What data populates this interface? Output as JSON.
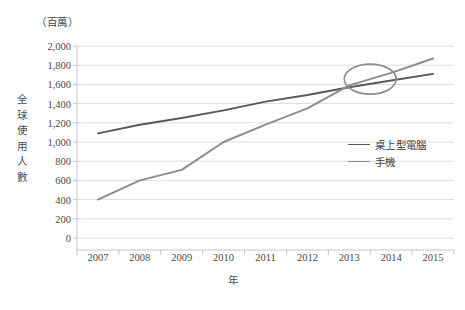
{
  "chart_data": {
    "type": "line",
    "title": "",
    "unit_label": "（百萬）",
    "xlabel": "年",
    "ylabel": "全球使用人數",
    "ylabel_chars": [
      "全",
      "球",
      "使",
      "用",
      "人",
      "數"
    ],
    "categories": [
      "2007",
      "2008",
      "2009",
      "2010",
      "2011",
      "2012",
      "2013",
      "2014",
      "2015"
    ],
    "x": [
      2007,
      2008,
      2009,
      2010,
      2011,
      2012,
      2013,
      2014,
      2015
    ],
    "ylim": [
      0,
      2000
    ],
    "ytick_values": [
      0,
      200,
      400,
      600,
      800,
      1000,
      1200,
      1400,
      1600,
      1800,
      2000
    ],
    "ytick_labels": [
      "0",
      "200",
      "400",
      "600",
      "800",
      "1,000",
      "1,200",
      "1,400",
      "1,600",
      "1,800",
      "2,000"
    ],
    "grid": "horizontal",
    "legend_position": "inside-right",
    "series": [
      {
        "name": "桌上型電腦",
        "color": "#595959",
        "values": [
          1090,
          1180,
          1250,
          1330,
          1420,
          1490,
          1570,
          1640,
          1710
        ]
      },
      {
        "name": "手機",
        "color": "#8c8c8c",
        "values": [
          400,
          600,
          710,
          1000,
          1180,
          1350,
          1590,
          1720,
          1870
        ]
      }
    ],
    "annotations": [
      {
        "name": "crossover-ellipse",
        "shape": "ellipse",
        "x": 2013.5,
        "y": 1655,
        "color": "#8c8c8c",
        "note": "手機 超越 桌上型電腦 交叉點"
      }
    ],
    "colors": {
      "gridline": "#d9d9d9",
      "axis": "#bfbfbf",
      "text": "#4a4a4a",
      "background": "#ffffff"
    }
  }
}
